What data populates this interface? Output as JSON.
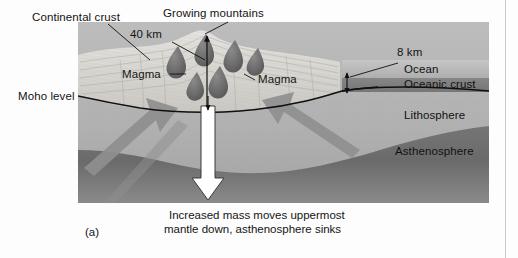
{
  "figure": {
    "panel_id": "(a)",
    "caption_line1": "Increased mass moves uppermost",
    "caption_line2": "mantle down, asthenosphere sinks"
  },
  "labels": {
    "continental_crust": "Continental crust",
    "growing_mountains": "Growing mountains",
    "depth_40km": "40 km",
    "depth_8km": "8 km",
    "magma_left": "Magma",
    "magma_right": "Magma",
    "moho_level": "Moho level",
    "ocean": "Ocean",
    "oceanic_crust": "Oceanic crust",
    "lithosphere": "Lithosphere",
    "asthenosphere": "Asthenosphere"
  },
  "colors": {
    "background": "#fdfdfd",
    "continental_crust": "#d8d6d2",
    "magma_body": "#6e6e6e",
    "ocean_water": "#b9b9b9",
    "oceanic_crust": "#7d7d7d",
    "lithosphere": "#b0b0b0",
    "asthenosphere": "#6a6a6a",
    "arrow_gray": "#8f8f8f",
    "arrow_white": "#ffffff",
    "outline": "#101010",
    "rule": "#c9c9c9"
  },
  "geometry": {
    "block_left": 78,
    "block_right": 489,
    "block_top": 22,
    "block_bottom": 203
  }
}
